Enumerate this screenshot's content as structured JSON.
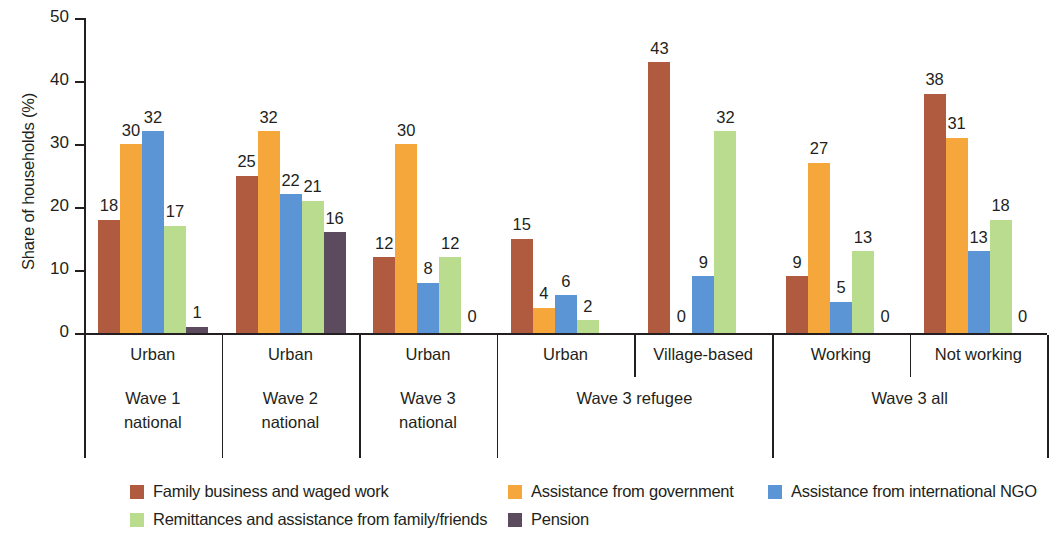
{
  "chart_data": {
    "type": "bar",
    "title": "",
    "xlabel": "",
    "ylabel": "Share of households (%)",
    "ylim": [
      0,
      50
    ],
    "yticks": [
      0,
      10,
      20,
      30,
      40,
      50
    ],
    "grid": false,
    "legend_position": "bottom",
    "series": [
      {
        "name": "Family business and waged work",
        "color": "#b05b3f",
        "values": [
          18,
          25,
          12,
          15,
          43,
          9,
          38
        ]
      },
      {
        "name": "Assistance from government",
        "color": "#f6a73b",
        "values": [
          30,
          32,
          30,
          4,
          0,
          27,
          31
        ]
      },
      {
        "name": "Assistance from international NGO",
        "color": "#5b95d6",
        "values": [
          32,
          22,
          8,
          6,
          9,
          5,
          13
        ]
      },
      {
        "name": "Remittances and assistance from family/friends",
        "color": "#b9dc8e",
        "values": [
          17,
          21,
          12,
          2,
          32,
          13,
          18
        ]
      },
      {
        "name": "Pension",
        "color": "#5c4a5e",
        "values": [
          1,
          16,
          0,
          0,
          null,
          0,
          0
        ]
      }
    ],
    "categories": [
      "Urban",
      "Urban",
      "Urban",
      "Urban",
      "Village-based",
      "Working",
      "Not working"
    ],
    "group_labels": [
      {
        "label": "Wave 1\nnational",
        "span": 1
      },
      {
        "label": "Wave 2\nnational",
        "span": 1
      },
      {
        "label": "Wave 3\nnational",
        "span": 1
      },
      {
        "label": "Wave 3 refugee",
        "span": 2
      },
      {
        "label": "Wave 3 all",
        "span": 2
      }
    ]
  },
  "axis": {
    "y_title": "Share of households (%)",
    "y_ticks": [
      "0",
      "10",
      "20",
      "30",
      "40",
      "50"
    ]
  },
  "groups": [
    {
      "category": "Urban",
      "wave": "Wave 1\nnational",
      "bars": [
        {
          "series": "Family business and waged work",
          "value": 18,
          "label": "18"
        },
        {
          "series": "Assistance from government",
          "value": 30,
          "label": "30"
        },
        {
          "series": "Assistance from international NGO",
          "value": 32,
          "label": "32"
        },
        {
          "series": "Remittances and assistance from family/friends",
          "value": 17,
          "label": "17"
        },
        {
          "series": "Pension",
          "value": 1,
          "label": "1"
        }
      ]
    },
    {
      "category": "Urban",
      "wave": "Wave 2\nnational",
      "bars": [
        {
          "series": "Family business and waged work",
          "value": 25,
          "label": "25"
        },
        {
          "series": "Assistance from government",
          "value": 32,
          "label": "32"
        },
        {
          "series": "Assistance from international NGO",
          "value": 22,
          "label": "22"
        },
        {
          "series": "Remittances and assistance from family/friends",
          "value": 21,
          "label": "21"
        },
        {
          "series": "Pension",
          "value": 16,
          "label": "16"
        }
      ]
    },
    {
      "category": "Urban",
      "wave": "Wave 3\nnational",
      "bars": [
        {
          "series": "Family business and waged work",
          "value": 12,
          "label": "12"
        },
        {
          "series": "Assistance from government",
          "value": 30,
          "label": "30"
        },
        {
          "series": "Assistance from international NGO",
          "value": 8,
          "label": "8"
        },
        {
          "series": "Remittances and assistance from family/friends",
          "value": 12,
          "label": "12"
        },
        {
          "series": "Pension",
          "value": 0,
          "label": "0"
        }
      ]
    },
    {
      "category": "Urban",
      "wave": "Wave 3 refugee",
      "bars": [
        {
          "series": "Family business and waged work",
          "value": 15,
          "label": "15"
        },
        {
          "series": "Assistance from government",
          "value": 4,
          "label": "4"
        },
        {
          "series": "Assistance from international NGO",
          "value": 6,
          "label": "6"
        },
        {
          "series": "Remittances and assistance from family/friends",
          "value": 2,
          "label": "2"
        },
        {
          "series": "Pension",
          "value": 0,
          "label": ""
        }
      ]
    },
    {
      "category": "Village-based",
      "wave": "Wave 3 refugee",
      "bars": [
        {
          "series": "Family business and waged work",
          "value": 43,
          "label": "43"
        },
        {
          "series": "Assistance from government",
          "value": 0,
          "label": "0"
        },
        {
          "series": "Assistance from international NGO",
          "value": 9,
          "label": "9"
        },
        {
          "series": "Remittances and assistance from family/friends",
          "value": 32,
          "label": "32"
        },
        {
          "series": "Pension",
          "value": 0,
          "label": ""
        }
      ]
    },
    {
      "category": "Working",
      "wave": "Wave 3 all",
      "bars": [
        {
          "series": "Family business and waged work",
          "value": 9,
          "label": "9"
        },
        {
          "series": "Assistance from government",
          "value": 27,
          "label": "27"
        },
        {
          "series": "Assistance from international NGO",
          "value": 5,
          "label": "5"
        },
        {
          "series": "Remittances and assistance from family/friends",
          "value": 13,
          "label": "13"
        },
        {
          "series": "Pension",
          "value": 0,
          "label": "0"
        }
      ]
    },
    {
      "category": "Not working",
      "wave": "Wave 3 all",
      "bars": [
        {
          "series": "Family business and waged work",
          "value": 38,
          "label": "38"
        },
        {
          "series": "Assistance from government",
          "value": 31,
          "label": "31"
        },
        {
          "series": "Assistance from international NGO",
          "value": 13,
          "label": "13"
        },
        {
          "series": "Remittances and assistance from family/friends",
          "value": 18,
          "label": "18"
        },
        {
          "series": "Pension",
          "value": 0,
          "label": "0"
        }
      ]
    }
  ],
  "wave_bands": [
    {
      "label": "Wave 1",
      "label2": "national",
      "groups": [
        0
      ]
    },
    {
      "label": "Wave 2",
      "label2": "national",
      "groups": [
        1
      ]
    },
    {
      "label": "Wave 3",
      "label2": "national",
      "groups": [
        2
      ]
    },
    {
      "label": "Wave 3 refugee",
      "label2": "",
      "groups": [
        3,
        4
      ]
    },
    {
      "label": "Wave 3 all",
      "label2": "",
      "groups": [
        5,
        6
      ]
    }
  ],
  "legend": {
    "items": [
      {
        "label": "Family business and waged work",
        "color": "#b05b3f"
      },
      {
        "label": "Assistance from government",
        "color": "#f6a73b"
      },
      {
        "label": "Assistance from international NGO",
        "color": "#5b95d6"
      },
      {
        "label": "Remittances and assistance from family/friends",
        "color": "#b9dc8e"
      },
      {
        "label": "Pension",
        "color": "#5c4a5e"
      }
    ]
  },
  "colors": {
    "axis": "#231f20",
    "text": "#231f20",
    "background": "#ffffff"
  }
}
